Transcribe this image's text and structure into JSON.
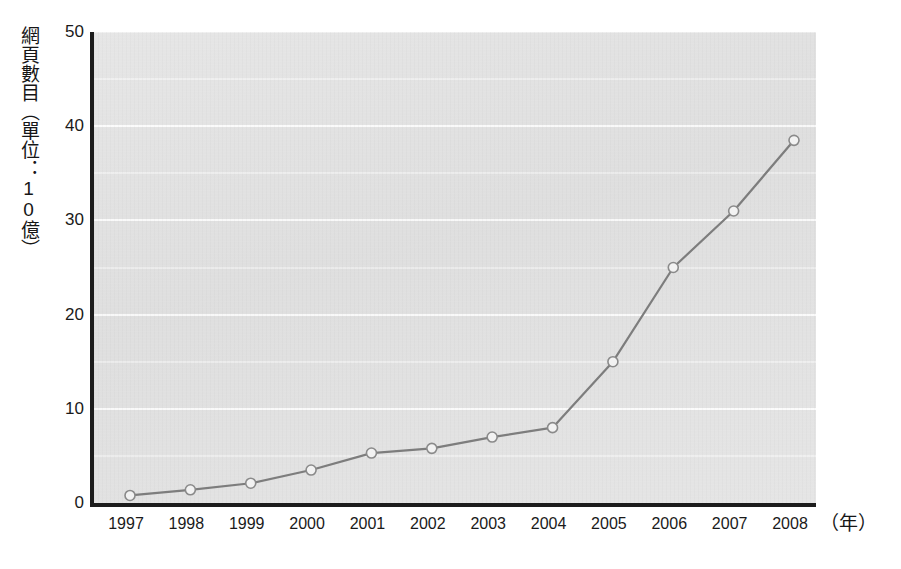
{
  "chart_data": {
    "type": "line",
    "title": "",
    "subtitle": "",
    "ylabel": "網頁數目（單位：10億）",
    "xlabel": "（年）",
    "categories": [
      "1997",
      "1998",
      "1999",
      "2000",
      "2001",
      "2002",
      "2003",
      "2004",
      "2005",
      "2006",
      "2007",
      "2008"
    ],
    "x": [
      1997,
      1998,
      1999,
      2000,
      2001,
      2002,
      2003,
      2004,
      2005,
      2006,
      2007,
      2008
    ],
    "values": [
      0.8,
      1.4,
      2.1,
      3.5,
      5.3,
      5.8,
      7.0,
      8.0,
      15.0,
      25.0,
      31.0,
      38.5
    ],
    "series": [
      {
        "name": "網頁數目",
        "values": [
          0.8,
          1.4,
          2.1,
          3.5,
          5.3,
          5.8,
          7.0,
          8.0,
          15.0,
          25.0,
          31.0,
          38.5
        ]
      }
    ],
    "ylim": [
      0,
      50
    ],
    "yticks": [
      0,
      10,
      20,
      30,
      40,
      50
    ],
    "ytick_labels": [
      "0",
      "10",
      "20",
      "30",
      "40",
      "50"
    ],
    "minor_yticks": [
      5,
      15,
      25,
      35,
      45
    ],
    "grid": true,
    "grid_axis": "y",
    "legend": false,
    "legend_position": "none",
    "marker": "circle",
    "colors": {
      "plot_background": "#e3e3e3",
      "gridline": "#fdfdfd",
      "line": "#7d7d7d",
      "marker_fill": "#f2f2f2",
      "marker_stroke": "#8a8a8a",
      "axis": "#1c1c1c",
      "text": "#1a1a1a"
    }
  }
}
